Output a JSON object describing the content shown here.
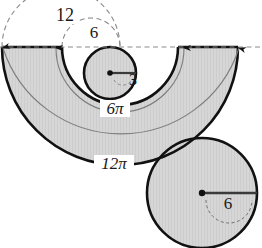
{
  "figure": {
    "background_color": "#ffffff",
    "fill_color": "#d5d5d5",
    "stroke_color": "#111111",
    "thin_arc_color": "#8a8a8a",
    "dashed_color": "#8a8a8a",
    "labels": {
      "outer_diameter": "12",
      "inner_diameter": "6",
      "small_circle_radius": "3",
      "large_circle_radius": "6",
      "inner_arc_length": "6π",
      "outer_arc_length": "12π"
    },
    "shapes": {
      "semi_annulus": {
        "center_x": 120,
        "center_y": 47,
        "outer_radius": 118,
        "inner_radius": 58
      },
      "small_circle": {
        "center_x": 110,
        "center_y": 73,
        "radius": 26,
        "radius_label": "3"
      },
      "large_circle": {
        "center_x": 202,
        "center_y": 193,
        "radius": 55,
        "radius_label": "6"
      }
    },
    "dashed_arcs": [
      {
        "name": "outer-diameter-arc",
        "label": "12"
      },
      {
        "name": "inner-diameter-arc",
        "label": "6"
      }
    ],
    "measure_arrows": [
      {
        "name": "arrow-outer-left",
        "x": 3
      },
      {
        "name": "arrow-inner-left",
        "x": 56
      },
      {
        "name": "arrow-inner-right",
        "x": 185
      },
      {
        "name": "arrow-outer-right",
        "x": 239
      }
    ]
  }
}
